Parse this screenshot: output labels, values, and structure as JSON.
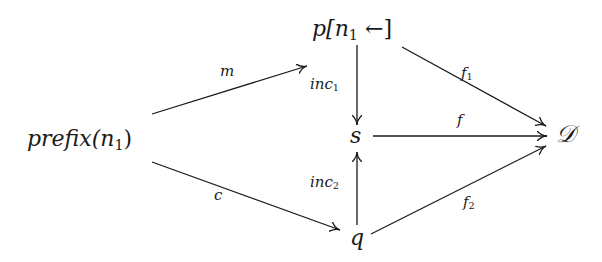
{
  "diagram": {
    "type": "commutative-diagram",
    "nodes": {
      "prefix": {
        "base": "prefix(n",
        "sub": "1",
        "close": ")"
      },
      "p": {
        "base": "p[n",
        "sub": "1",
        "arrow": " ←]"
      },
      "s": {
        "text": "s"
      },
      "q": {
        "text": "q"
      },
      "D": {
        "text": "𝒟"
      }
    },
    "edges": {
      "m": {
        "from": "prefix(n1)",
        "to": "p[n1 ←]",
        "label": "m"
      },
      "c": {
        "from": "prefix(n1)",
        "to": "q",
        "label": "c"
      },
      "inc1": {
        "from": "p[n1 ←]",
        "to": "s",
        "label_base": "inc",
        "label_sub": "1"
      },
      "inc2": {
        "from": "q",
        "to": "s",
        "label_base": "inc",
        "label_sub": "2"
      },
      "f": {
        "from": "s",
        "to": "D",
        "label": "f"
      },
      "f1": {
        "from": "p[n1 ←]",
        "to": "D",
        "label_base": "f",
        "label_sub": "1"
      },
      "f2": {
        "from": "q",
        "to": "D",
        "label_base": "f",
        "label_sub": "2"
      }
    },
    "colors": {
      "ink": "#1a1a1a",
      "background": "#ffffff"
    }
  }
}
